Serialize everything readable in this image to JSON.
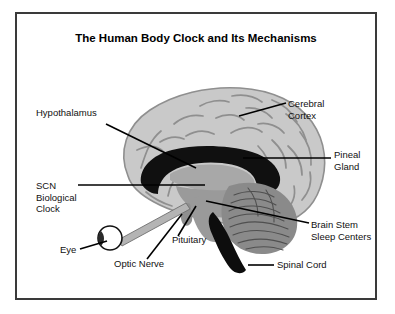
{
  "figure": {
    "title": "The Human Body Clock and Its Mechanisms",
    "background_color": "#ffffff",
    "frame_color": "#3a3a3a"
  },
  "palette": {
    "cortex_fill": "#c9c9c9",
    "cortex_outline": "#8f8f8f",
    "sulci": "#8f8f8f",
    "corpus_callosum_black": "#101010",
    "thalamus_gray": "#a8a8a8",
    "brainstem_gray": "#9a9a9a",
    "cerebellum_gray": "#8a8a8a",
    "spinal_cord_black": "#0d0d0d",
    "eye_fill": "#ffffff",
    "eye_outline": "#111111",
    "lens_dark": "#2a2a2a",
    "leader_line": "#000000",
    "label_text": "#111111"
  },
  "labels": [
    {
      "id": "hypothalamus",
      "name": "Hypothalamus",
      "lines": [
        "Hypothalamus"
      ],
      "anchor": "start",
      "text_x": 36,
      "text_y": 116,
      "line_height": 11.5
    },
    {
      "id": "scn-biological-clock",
      "name": "SCN Biological Clock",
      "lines": [
        "SCN",
        "Biological",
        "Clock"
      ],
      "anchor": "start",
      "text_x": 36,
      "text_y": 189,
      "line_height": 11.5
    },
    {
      "id": "eye",
      "name": "Eye",
      "lines": [
        "Eye"
      ],
      "anchor": "start",
      "text_x": 60,
      "text_y": 253,
      "line_height": 11.5
    },
    {
      "id": "optic-nerve",
      "name": "Optic Nerve",
      "lines": [
        "Optic Nerve"
      ],
      "anchor": "start",
      "text_x": 114,
      "text_y": 267,
      "line_height": 11.5
    },
    {
      "id": "pituitary",
      "name": "Pituitary",
      "lines": [
        "Pituitary"
      ],
      "anchor": "start",
      "text_x": 172,
      "text_y": 243,
      "line_height": 11.5
    },
    {
      "id": "cerebral-cortex",
      "name": "Cerebral Cortex",
      "lines": [
        "Cerebral",
        "Cortex"
      ],
      "anchor": "start",
      "text_x": 288,
      "text_y": 107,
      "line_height": 11.5
    },
    {
      "id": "pineal-gland",
      "name": "Pineal Gland",
      "lines": [
        "Pineal",
        "Gland"
      ],
      "anchor": "start",
      "text_x": 334,
      "text_y": 158,
      "line_height": 11.5
    },
    {
      "id": "brain-stem-sleep-centers",
      "name": "Brain Stem Sleep Centers",
      "lines": [
        "Brain Stem",
        "Sleep Centers"
      ],
      "anchor": "start",
      "text_x": 311,
      "text_y": 228,
      "line_height": 11.5
    },
    {
      "id": "spinal-cord",
      "name": "Spinal Cord",
      "lines": [
        "Spinal Cord"
      ],
      "anchor": "start",
      "text_x": 277,
      "text_y": 268,
      "line_height": 11.5
    }
  ],
  "leader_lines": [
    {
      "id": "hypothalamus-leader",
      "points": "106,124 196,168"
    },
    {
      "id": "scn-leader",
      "points": "78,185 205,185"
    },
    {
      "id": "eye-leader",
      "points": "80,249 107,241"
    },
    {
      "id": "optic-nerve-leader",
      "points": "147,259 182,214"
    },
    {
      "id": "pituitary-leader",
      "points": "178,236 196,206"
    },
    {
      "id": "cerebral-cortex-leader",
      "points": "239,116 286,103"
    },
    {
      "id": "pineal-gland-leader",
      "points": "243,158 331,158"
    },
    {
      "id": "brain-stem-leader",
      "points": "206,201 309,223"
    },
    {
      "id": "spinal-cord-leader",
      "points": "248,265 274,265"
    }
  ],
  "structures": [
    {
      "id": "cerebral-cortex-body",
      "name": "cerebral-cortex"
    },
    {
      "id": "corpus-callosum",
      "name": "corpus-callosum-hypothalamus-region"
    },
    {
      "id": "thalamus",
      "name": "thalamus"
    },
    {
      "id": "brainstem",
      "name": "brain-stem"
    },
    {
      "id": "cerebellum",
      "name": "cerebellum"
    },
    {
      "id": "spinal-cord-body",
      "name": "spinal-cord"
    },
    {
      "id": "pituitary-body",
      "name": "pituitary-gland"
    },
    {
      "id": "eyeball",
      "name": "eyeball"
    },
    {
      "id": "optic-nerve-body",
      "name": "optic-nerve"
    }
  ]
}
